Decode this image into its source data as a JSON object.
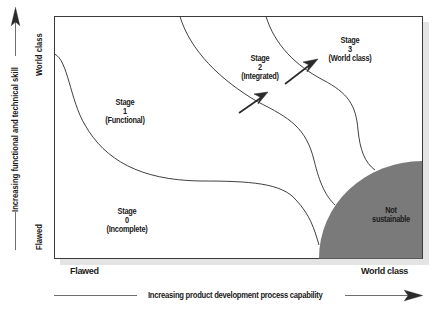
{
  "diagram": {
    "type": "stage-maturity-map",
    "x_axis": {
      "label": "Increasing product development process capability",
      "min_label": "Flawed",
      "max_label": "World class"
    },
    "y_axis": {
      "label": "Increasing functional and technical skill",
      "min_label": "Flawed",
      "max_label": "World class"
    },
    "stages": [
      {
        "title": "Stage",
        "number": "0",
        "name": "(Incomplete)"
      },
      {
        "title": "Stage",
        "number": "1",
        "name": "(Functional)"
      },
      {
        "title": "Stage",
        "number": "2",
        "name": "(Integrated)"
      },
      {
        "title": "Stage",
        "number": "3",
        "name": "(World class)"
      }
    ],
    "region": {
      "line1": "Not",
      "line2": "sustainable"
    },
    "colors": {
      "frame": "#3a3a3a",
      "not_sustainable_fill": "#7a7a7a",
      "shadow": "#e4e4e4",
      "text": "#1a1a1a"
    }
  }
}
